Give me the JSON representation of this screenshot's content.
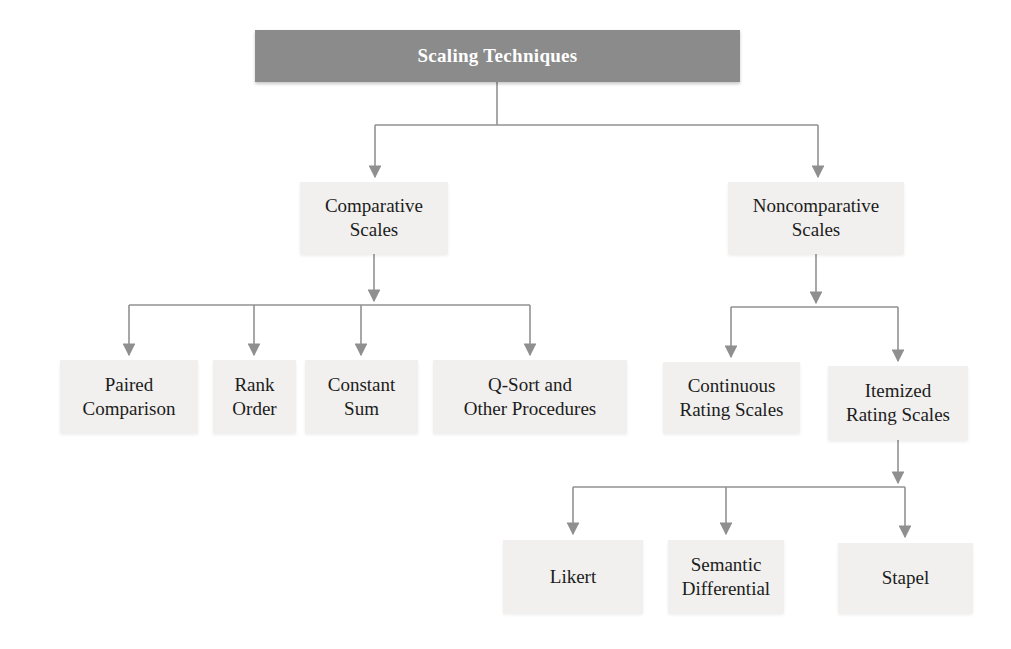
{
  "page": {
    "background": "#ffffff"
  },
  "colors": {
    "root_fill": "#8b8b8b",
    "root_text": "#ffffff",
    "node_fill": "#f1f0ee",
    "node_text": "#1c1c1c",
    "connector": "#929292"
  },
  "tree": {
    "root": {
      "label": "Scaling Techniques"
    },
    "comparative": {
      "label": "Comparative\nScales",
      "children": [
        {
          "label": "Paired\nComparison"
        },
        {
          "label": "Rank\nOrder"
        },
        {
          "label": "Constant\nSum"
        },
        {
          "label": "Q-Sort and\nOther Procedures"
        }
      ]
    },
    "noncomparative": {
      "label": "Noncomparative\nScales",
      "children": [
        {
          "label": "Continuous\nRating Scales"
        },
        {
          "label": "Itemized\nRating Scales",
          "children": [
            {
              "label": "Likert"
            },
            {
              "label": "Semantic\nDifferential"
            },
            {
              "label": "Stapel"
            }
          ]
        }
      ]
    }
  }
}
